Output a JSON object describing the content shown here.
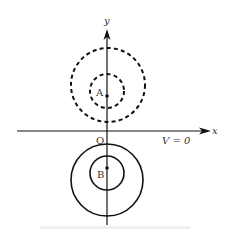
{
  "figure": {
    "axes": {
      "x_label": "x",
      "y_label": "y",
      "origin_label": "O"
    },
    "points": [
      {
        "label": "A",
        "x": 107,
        "y": 96
      },
      {
        "label": "B",
        "x": 107,
        "y": 168
      }
    ],
    "potential_label": "V = 0",
    "caption": "",
    "circles": {
      "dashed": [
        {
          "cx": 108,
          "cy": 85,
          "r": 37
        },
        {
          "cx": 107,
          "cy": 91,
          "r": 17
        }
      ],
      "solid": [
        {
          "cx": 107,
          "cy": 180,
          "r": 36
        },
        {
          "cx": 107,
          "cy": 173,
          "r": 17
        }
      ]
    },
    "colors": {
      "stroke": "#111111"
    }
  }
}
